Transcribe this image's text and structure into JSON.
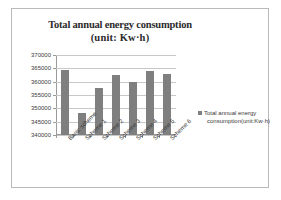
{
  "chart_data": {
    "type": "bar",
    "title": "Total annual energy consumption (unit: Kw·h)",
    "title_line1": "Total annual energy consumption",
    "title_line2": "(unit: Kw·h)",
    "categories": [
      "Basic scheme",
      "Scheme 1",
      "Scheme 2",
      "Scheme 3",
      "Scheme 4",
      "Scheme 5",
      "Scheme 6"
    ],
    "values": [
      364500,
      348200,
      357500,
      362500,
      360000,
      364000,
      363000
    ],
    "series": [
      {
        "name": "Total annual energy consumption(unit:Kw·h)",
        "values": [
          364500,
          348200,
          357500,
          362500,
          360000,
          364000,
          363000
        ]
      }
    ],
    "xlabel": "",
    "ylabel": "",
    "ylim": [
      340000,
      370000
    ],
    "ytick_step": 5000,
    "yticks": [
      370000,
      365000,
      360000,
      355000,
      350000,
      345000,
      340000
    ],
    "ytick_labels": [
      "370000",
      "365000",
      "360000",
      "355000",
      "350000",
      "345000",
      "340000"
    ],
    "grid": true,
    "grid_axis": "y",
    "legend_position": "right",
    "bar_color": "#7f7f7f",
    "legend": {
      "line1": "Total annual energy",
      "line2": "consumption(unit:Kw·h)",
      "label": "Total annual energy consumption(unit:Kw·h)"
    }
  }
}
